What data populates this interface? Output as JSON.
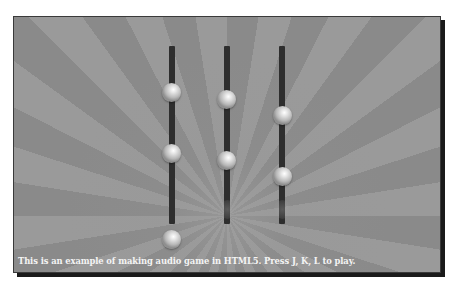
{
  "game": {
    "caption": "This is an example of making audio game in HTML5. Press J, K, L to play.",
    "keys": [
      "J",
      "K",
      "L"
    ],
    "colors": {
      "background": "#8c8c8c",
      "track": "#2e2e2e",
      "ball_highlight": "#ffffff",
      "caption": "#f4f4f4",
      "frame_shadow": "#1a1a1a"
    },
    "tracks": [
      {
        "key": "J",
        "x": 158,
        "balls_y": [
          66,
          127,
          213
        ]
      },
      {
        "key": "K",
        "x": 213,
        "balls_y": [
          73,
          134
        ]
      },
      {
        "key": "L",
        "x": 268,
        "balls_y": [
          89,
          150
        ]
      }
    ],
    "hit_markers": [
      {
        "track": "K",
        "y": 183
      },
      {
        "track": "L",
        "y": 183
      }
    ]
  }
}
